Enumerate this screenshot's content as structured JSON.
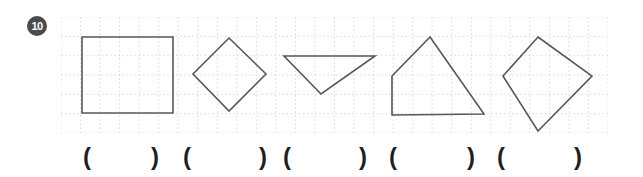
{
  "question": {
    "number": "10",
    "badge_color": "#4b4b4b"
  },
  "grid": {
    "columns": 28,
    "rows": 6,
    "width": 547,
    "height": 116,
    "line_color": "#d6d9db",
    "line_dash": "1.5 2.6",
    "shape_stroke_color": "#55595c",
    "shape_stroke_width": 1.6
  },
  "shapes": [
    {
      "name": "square",
      "points": "21,20 112,20 112,96 21,96"
    },
    {
      "name": "diamond",
      "points": "168,21 205,57 168,94 132,57"
    },
    {
      "name": "triangle",
      "points": "223,39 314,39 260,77"
    },
    {
      "name": "quadrilateral",
      "points": "369,20 423,97 331,98 331,59"
    },
    {
      "name": "kite",
      "points": "477,20 531,59 477,114 442,59"
    }
  ],
  "answer_slots": [
    {
      "open": "(",
      "close": ")"
    },
    {
      "open": "(",
      "close": ")"
    },
    {
      "open": "(",
      "close": ")"
    },
    {
      "open": "(",
      "close": ")"
    },
    {
      "open": "(",
      "close": ")"
    }
  ]
}
